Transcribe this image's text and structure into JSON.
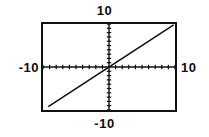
{
  "screen": {
    "background_color": "#ffffff",
    "ink_color": "#111111"
  },
  "labels": {
    "top": "10",
    "bottom": "-10",
    "left": "-10",
    "right": "10"
  },
  "chart_data": {
    "type": "line",
    "title": "",
    "subtitle": "",
    "xlabel": "",
    "ylabel": "",
    "xlim": [
      -10,
      10
    ],
    "ylim": [
      -10,
      10
    ],
    "grid": false,
    "legend": "none",
    "axes": {
      "x_axis_at_y": 0,
      "y_axis_at_x": 0,
      "x_tick_spacing": 1,
      "y_tick_spacing": 1,
      "x_tick_labels": [
        "-10",
        "10"
      ],
      "y_tick_labels": [
        "-10",
        "10"
      ],
      "tick_style": "dotted-marks-on-axis"
    },
    "series": [
      {
        "name": "line",
        "equation": "y = x",
        "slope": 1,
        "intercept": 0,
        "x": [
          -9.2,
          9.8
        ],
        "y": [
          -9.2,
          9.8
        ]
      }
    ],
    "annotations": []
  }
}
